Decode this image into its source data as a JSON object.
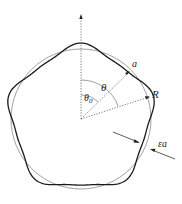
{
  "diagram": {
    "labels": {
      "a": "a",
      "theta": "θ",
      "theta0_main": "θ",
      "theta0_sub": "0",
      "R": "R",
      "epsilon_a": "εa"
    },
    "lobes": 5,
    "colors": {
      "circle": "#8a8a8a",
      "curve": "#1a1a1a",
      "dotted": "#555555",
      "text": "#222222"
    }
  }
}
